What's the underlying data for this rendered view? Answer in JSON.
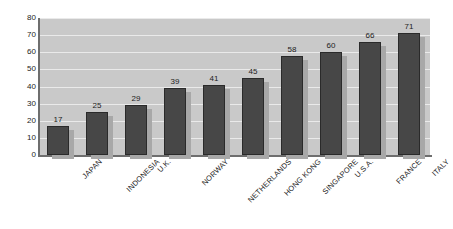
{
  "chart_data": {
    "type": "bar",
    "title": "",
    "subtitle": "",
    "xlabel": "",
    "ylabel": "",
    "categories": [
      "JAPAN",
      "INDONESIA",
      "U.K.",
      "NORWAY",
      "NETHERLANDS",
      "HONG KONG",
      "SINGAPORE",
      "U.S.A.",
      "FRANCE",
      "ITALY"
    ],
    "values": [
      17,
      25,
      29,
      39,
      41,
      45,
      58,
      60,
      66,
      71
    ],
    "value_labels": [
      "17",
      "25",
      "29",
      "39",
      "41",
      "45",
      "58",
      "60",
      "66",
      "71"
    ],
    "ylim": [
      0,
      80
    ],
    "ytick_labels": [
      "80",
      "70",
      "60",
      "50",
      "40",
      "30",
      "20",
      "10",
      "0"
    ],
    "ytick_values": [
      80,
      70,
      60,
      50,
      40,
      30,
      20,
      10,
      0
    ],
    "grid": true,
    "grid_orientation": "horizontal",
    "legend": null,
    "legend_position": "none",
    "colors": {
      "bar_fill": "#474747",
      "bar_border": "#2a2a2a",
      "bar_shadow": "#a8a8a8",
      "plot_background": "#c9c9c9",
      "gridline": "#eaeaea",
      "axis_line": "#6e6e6e",
      "text": "#1c1c1c",
      "page_background": "#ffffff"
    },
    "label_rotation_degrees": -45
  }
}
